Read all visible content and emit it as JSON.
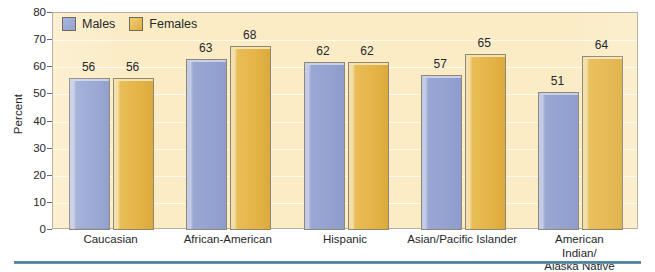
{
  "chart_data": {
    "type": "bar",
    "title": "",
    "subtitle": "",
    "xlabel": "",
    "ylabel": "Percent",
    "ylim": [
      0,
      80
    ],
    "ytick_step": 10,
    "yticks": [
      "0",
      "10",
      "20",
      "30",
      "40",
      "50",
      "60",
      "70",
      "80"
    ],
    "grid": true,
    "legend_position": "top-left",
    "categories": [
      "Caucasian",
      "African-American",
      "Hispanic",
      "Asian/Pacific Islander",
      "American Indian/\nAlaska Native"
    ],
    "series": [
      {
        "name": "Males",
        "color": "#94a2d0",
        "values": [
          56,
          63,
          62,
          57,
          51
        ]
      },
      {
        "name": "Females",
        "color": "#e3b244",
        "values": [
          56,
          68,
          62,
          65,
          64
        ]
      }
    ],
    "data_labels": [
      [
        "56",
        "63",
        "62",
        "57",
        "51"
      ],
      [
        "56",
        "68",
        "62",
        "65",
        "64"
      ]
    ]
  },
  "legend": {
    "items": [
      {
        "label": "Males",
        "swatch": "male-swatch"
      },
      {
        "label": "Females",
        "swatch": "female-swatch"
      }
    ]
  },
  "colors": {
    "plot_background": "#fbecc6",
    "males_bar": "#94a2d0",
    "females_bar": "#e3b244",
    "axis_text": "#26282b",
    "rule": "#4d7f99",
    "page_background": "#ffffff"
  }
}
